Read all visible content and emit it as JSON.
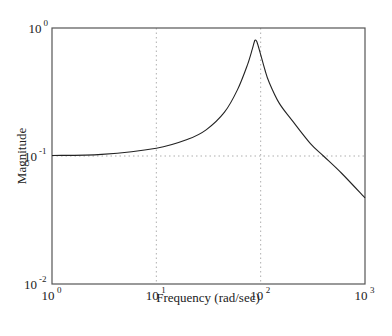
{
  "chart_data": {
    "type": "line",
    "title": "",
    "xlabel": "Frequency (rad/sec)",
    "ylabel": "Magnitude",
    "xscale": "log",
    "yscale": "log",
    "xlim": [
      1,
      1000
    ],
    "ylim": [
      0.01,
      1
    ],
    "grid": true,
    "x_ticks": [
      {
        "base": "10",
        "exp": "0",
        "value": 1
      },
      {
        "base": "10",
        "exp": "1",
        "value": 10
      },
      {
        "base": "10",
        "exp": "2",
        "value": 100
      },
      {
        "base": "10",
        "exp": "3",
        "value": 1000
      }
    ],
    "y_ticks": [
      {
        "base": "10",
        "exp": "0",
        "value": 1
      },
      {
        "base": "10",
        "exp": "-1",
        "value": 0.1
      },
      {
        "base": "10",
        "exp": "-2",
        "value": 0.01
      }
    ],
    "series": [
      {
        "name": "Magnitude",
        "color": "#222222",
        "x": [
          1,
          3,
          10,
          20,
          30,
          45,
          60,
          75,
          83,
          88,
          92,
          100,
          110,
          120,
          150,
          200,
          300,
          400,
          600,
          1000
        ],
        "y": [
          0.101,
          0.103,
          0.115,
          0.135,
          0.16,
          0.22,
          0.33,
          0.52,
          0.68,
          0.8,
          0.78,
          0.62,
          0.47,
          0.38,
          0.26,
          0.19,
          0.125,
          0.1,
          0.073,
          0.047
        ]
      }
    ]
  },
  "axes": {
    "xlabel": "Frequency (rad/sec)",
    "ylabel": "Magnitude"
  },
  "colors": {
    "axis": "#555555",
    "grid": "#9a9a9a",
    "line": "#222222"
  }
}
